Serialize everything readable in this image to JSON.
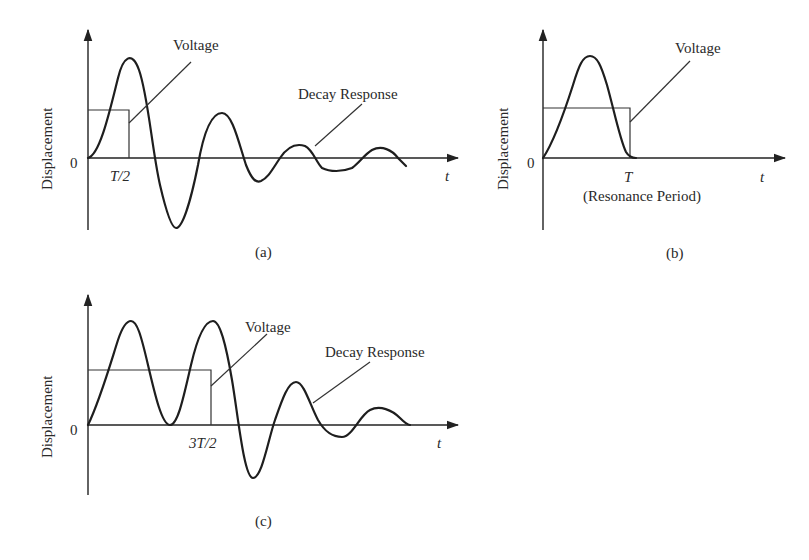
{
  "panels": [
    {
      "id": "a",
      "caption": "(a)",
      "y_axis_label": "Displacement",
      "x_axis_label": "t",
      "origin_label": "0",
      "pulse_end_label": "T/2",
      "voltage_label": "Voltage",
      "response_label": "Decay Response"
    },
    {
      "id": "b",
      "caption": "(b)",
      "y_axis_label": "Displacement",
      "x_axis_label": "t",
      "origin_label": "0",
      "pulse_end_label": "T",
      "pulse_end_sublabel": "(Resonance Period)",
      "voltage_label": "Voltage"
    },
    {
      "id": "c",
      "caption": "(c)",
      "y_axis_label": "Displacement",
      "x_axis_label": "t",
      "origin_label": "0",
      "pulse_end_label": "3T/2",
      "voltage_label": "Voltage",
      "response_label": "Decay Response"
    }
  ],
  "colors": {
    "ink": "#1e1e1e",
    "background": "#ffffff"
  }
}
